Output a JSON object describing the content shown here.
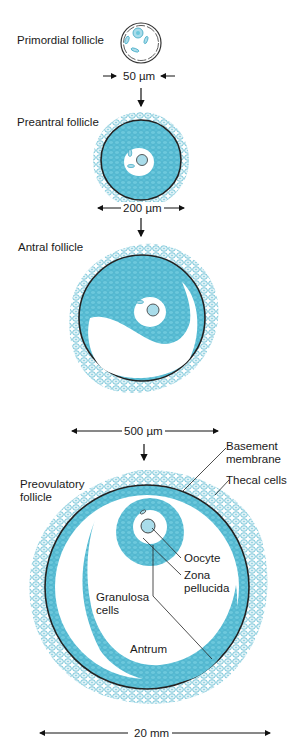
{
  "stages": [
    {
      "name": "Primordial follicle",
      "size": "50 µm"
    },
    {
      "name": "Preantral follicle",
      "size": "200 µm"
    },
    {
      "name": "Antral follicle",
      "size": "500 µm"
    },
    {
      "name": "Preovulatory follicle",
      "size": "20 mm"
    }
  ],
  "labels": {
    "primordial": "Primordial follicle",
    "preantral": "Preantral follicle",
    "antral": "Antral follicle",
    "preovulatory_line1": "Preovulatory",
    "preovulatory_line2": "follicle",
    "basement_line1": "Basement",
    "basement_line2": "membrane",
    "thecal": "Thecal cells",
    "oocyte": "Oocyte",
    "zona_line1": "Zona",
    "zona_line2": "pellucida",
    "granulosa_line1": "Granulosa",
    "granulosa_line2": "cells",
    "antrum": "Antrum"
  },
  "scales": {
    "s1": "50 µm",
    "s2": "200 µm",
    "s3": "500 µm",
    "s4": "20 mm"
  },
  "colors": {
    "cell_fill": "#5bbfd6",
    "cell_light": "#d9f0f6",
    "cell_outline": "#3aa6c2",
    "membrane": "#222222",
    "text": "#1a1a1a"
  }
}
